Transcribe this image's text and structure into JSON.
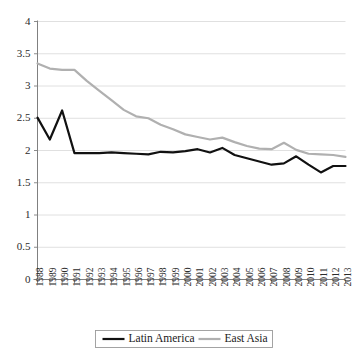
{
  "chart_data": {
    "type": "line",
    "title": "",
    "subtitle": "",
    "xlabel": "",
    "ylabel": "",
    "grid": true,
    "legend_position": "bottom",
    "xlim": [
      1988,
      2013
    ],
    "ylim": [
      0,
      4
    ],
    "y_ticks": [
      0,
      0.5,
      1,
      1.5,
      2,
      2.5,
      3,
      3.5,
      4
    ],
    "y_tick_labels": [
      "0",
      "0.5",
      "1",
      "1.5",
      "2",
      "2.5",
      "3",
      "3.5",
      "4"
    ],
    "x": [
      1988,
      1989,
      1990,
      1991,
      1992,
      1993,
      1994,
      1995,
      1996,
      1997,
      1998,
      1999,
      2000,
      2001,
      2002,
      2003,
      2004,
      2005,
      2006,
      2007,
      2008,
      2009,
      2010,
      2011,
      2012,
      2013
    ],
    "x_tick_labels": [
      "1988",
      "1989",
      "1990",
      "1991",
      "1992",
      "1993",
      "1994",
      "1995",
      "1996",
      "1997",
      "1998",
      "1999",
      "2000",
      "2001",
      "2002",
      "2003",
      "2004",
      "2005",
      "2006",
      "2007",
      "2008",
      "2009",
      "2010",
      "2011",
      "2012",
      "2013"
    ],
    "series": [
      {
        "name": "Latin America",
        "color": "#111111",
        "width": 2.2,
        "values": [
          2.51,
          2.17,
          2.62,
          1.96,
          1.96,
          1.96,
          1.97,
          1.96,
          1.95,
          1.94,
          1.98,
          1.97,
          1.99,
          2.02,
          1.97,
          2.04,
          1.93,
          1.88,
          1.83,
          1.78,
          1.8,
          1.91,
          1.78,
          1.66,
          1.76,
          1.76
        ]
      },
      {
        "name": "East Asia",
        "color": "#b0b0b0",
        "width": 2.2,
        "values": [
          3.35,
          3.27,
          3.25,
          3.25,
          3.08,
          2.93,
          2.78,
          2.63,
          2.53,
          2.5,
          2.4,
          2.33,
          2.25,
          2.21,
          2.17,
          2.2,
          2.13,
          2.07,
          2.03,
          2.02,
          2.12,
          2.01,
          1.95,
          1.94,
          1.93,
          1.9
        ]
      }
    ]
  },
  "legend": {
    "entries": [
      {
        "label": "Latin America",
        "color": "#111111"
      },
      {
        "label": "East Asia",
        "color": "#b0b0b0"
      }
    ]
  }
}
